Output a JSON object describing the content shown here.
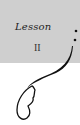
{
  "header": {
    "label": "Lesson",
    "number": "II"
  },
  "colors": {
    "panel": "#cfcfcf",
    "ink": "#111111"
  }
}
